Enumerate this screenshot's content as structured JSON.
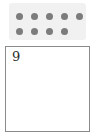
{
  "worksheet": {
    "dot_panel": {
      "name": "dot-group",
      "total_dots": 9,
      "dot_color": "#7c7c7c",
      "panel_color": "#f1f1f1",
      "rows": [
        {
          "count": 5
        },
        {
          "count": 4
        }
      ]
    },
    "answer_box": {
      "value": "9",
      "placeholder": "",
      "border_color": "#8a8a8a",
      "background_color": "#ffffff"
    }
  }
}
